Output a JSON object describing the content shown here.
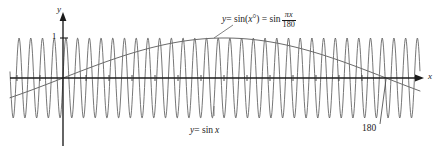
{
  "figure": {
    "background": "#ffffff",
    "curve_color": "#5a5a5a",
    "axis_color": "#1a1a1a",
    "text_color": "#1a1a1a"
  },
  "axes": {
    "x_label": "x",
    "y_label": "y",
    "y_tick_label": "1",
    "origin_px": {
      "x": 63,
      "y": 78
    },
    "x_range_px": [
      10,
      420
    ],
    "y_range_px": [
      14,
      146
    ]
  },
  "labels": {
    "formula_lhs": "y",
    "formula_eq1": "= sin(",
    "formula_arg": "x",
    "formula_deg": "°",
    "formula_eq2": ") = sin",
    "formula_frac_num_pi": "π",
    "formula_frac_num_x": "x",
    "formula_frac_den": "180",
    "formula_full_text": "y = sin(x°) = sin πx/180",
    "bottom_label_y": "y",
    "bottom_label_rest": "= sin",
    "bottom_label_x": "x",
    "bottom_label_full": "y = sin x",
    "point_label_180": "180"
  },
  "chart_data": {
    "type": "line",
    "xlabel": "x",
    "ylabel": "y",
    "grid": false,
    "legend": "inline-annotations",
    "xlim_degrees": [
      -75,
      430
    ],
    "ylim": [
      -1.25,
      1.25
    ],
    "y_ticks": [
      1
    ],
    "series": [
      {
        "name": "y = sin x",
        "description": "sine of x in radians, drawn as a very high frequency wave across the window",
        "amplitude": 1,
        "periods_visible": 35,
        "color": "#5a5a5a",
        "annotation": "y = sin x",
        "annotation_position": "below-axis-center"
      },
      {
        "name": "y = sin(x°)",
        "description": "sine of x in degrees, one slow arch peaking at x = 90 and crossing zero at x = 180",
        "amplitude": 1,
        "zero_crossings_degrees": [
          0,
          180
        ],
        "peak_degrees": 90,
        "peak_value": 1,
        "color": "#5a5a5a",
        "annotation": "y = sin(x°) = sin πx/180",
        "annotation_position": "above-peak"
      }
    ],
    "annotations": [
      {
        "text": "180",
        "points_to_degrees": 180,
        "points_to_value": 0
      },
      {
        "text": "1",
        "axis": "y",
        "value": 1
      }
    ]
  }
}
